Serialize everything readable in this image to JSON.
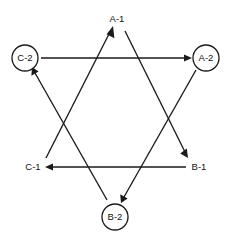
{
  "diagram": {
    "type": "hexagram-flow-diagram",
    "title": "",
    "background_color": "#ffffff",
    "line_color": "#1a1a1a",
    "text_color": "#111111",
    "nodes": [
      {
        "id": "A-1",
        "label": "A-1",
        "x": 117,
        "y": 19,
        "shape": "plain",
        "radius": 0
      },
      {
        "id": "C-2",
        "label": "C-2",
        "x": 25,
        "y": 58,
        "shape": "circled",
        "radius": 13
      },
      {
        "id": "A-2",
        "label": "A-2",
        "x": 206,
        "y": 58,
        "shape": "circled",
        "radius": 13
      },
      {
        "id": "C-1",
        "label": "C-1",
        "x": 35,
        "y": 167,
        "shape": "plain",
        "radius": 0
      },
      {
        "id": "B-1",
        "label": "B-1",
        "x": 198,
        "y": 167,
        "shape": "plain",
        "radius": 0
      },
      {
        "id": "B-2",
        "label": "B-2",
        "x": 115,
        "y": 217,
        "shape": "circled",
        "radius": 13
      }
    ],
    "edges": [
      {
        "id": "edge-c2-a2",
        "from": "C-2",
        "to": "A-2",
        "arrow": "to",
        "path": "horizontal-top"
      },
      {
        "id": "edge-b1-c1",
        "from": "B-1",
        "to": "C-1",
        "arrow": "to",
        "path": "horizontal-bottom"
      },
      {
        "id": "edge-c1-a1",
        "from": "C-1",
        "to": "A-1",
        "arrow": "to",
        "path": "diagonal-up-right"
      },
      {
        "id": "edge-a1-b1",
        "from": "A-1",
        "to": "B-1",
        "arrow": "to",
        "path": "diagonal-down-right"
      },
      {
        "id": "edge-a2-b2",
        "from": "A-2",
        "to": "B-2",
        "arrow": "to",
        "path": "diagonal-down-left"
      },
      {
        "id": "edge-b2-c2",
        "from": "B-2",
        "to": "C-2",
        "arrow": "to",
        "path": "diagonal-up-left"
      }
    ]
  }
}
